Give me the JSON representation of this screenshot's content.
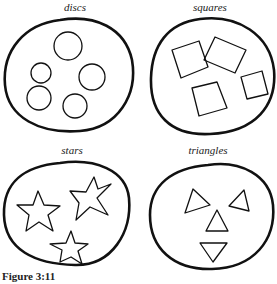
{
  "figure": {
    "caption": "Figure 3:11",
    "panels": [
      {
        "label": "discs",
        "shape": "circle",
        "count": 5
      },
      {
        "label": "squares",
        "shape": "square",
        "count": 4
      },
      {
        "label": "stars",
        "shape": "star",
        "count": 3
      },
      {
        "label": "triangles",
        "shape": "triangle",
        "count": 4
      }
    ]
  },
  "colors": {
    "stroke": "#111111",
    "background": "#ffffff"
  }
}
